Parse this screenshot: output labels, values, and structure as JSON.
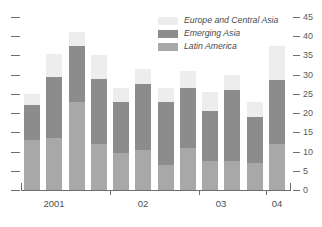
{
  "chart_data": {
    "type": "bar",
    "stacked": true,
    "title": "",
    "subtitle": "",
    "xlabel": "",
    "ylabel": "",
    "ylim": [
      0,
      45
    ],
    "yticks": [
      0,
      5,
      10,
      15,
      20,
      25,
      30,
      35,
      40,
      45
    ],
    "ytick_labels": [
      "0",
      "5",
      "10",
      "15",
      "20",
      "25",
      "30",
      "35",
      "40",
      "45"
    ],
    "y_axis_position": "right",
    "grid": false,
    "legend_position": "top-right",
    "categories": [
      "2001Q1",
      "2001Q2",
      "2001Q3",
      "2001Q4",
      "02Q1",
      "02Q2",
      "02Q3",
      "02Q4",
      "03Q1",
      "03Q2",
      "03Q3",
      "04Q1"
    ],
    "xtick_labels": [
      "2001",
      "02",
      "03",
      "04"
    ],
    "series": [
      {
        "name": "Latin America",
        "color": "#a8a8a8",
        "values": [
          13.0,
          13.5,
          23.0,
          12.0,
          9.5,
          10.5,
          6.5,
          11.0,
          7.5,
          7.5,
          7.0,
          12.0
        ]
      },
      {
        "name": "Emerging Asia",
        "color": "#8c8c8c",
        "values": [
          9.0,
          16.0,
          14.5,
          17.0,
          13.5,
          17.0,
          16.5,
          15.5,
          13.0,
          18.5,
          12.0,
          16.5
        ]
      },
      {
        "name": "Europe and Central Asia",
        "color": "#ededed",
        "values": [
          3.0,
          6.0,
          3.5,
          6.0,
          3.5,
          4.0,
          3.5,
          4.5,
          5.0,
          4.0,
          4.0,
          9.0
        ]
      }
    ],
    "totals": [
      25.0,
      35.5,
      41.0,
      35.0,
      26.5,
      31.5,
      26.5,
      31.0,
      25.5,
      30.0,
      23.0,
      37.5
    ]
  },
  "legend": {
    "items": [
      {
        "label": "Europe and Central Asia",
        "color": "#ededed"
      },
      {
        "label": "Emerging Asia",
        "color": "#8c8c8c"
      },
      {
        "label": "Latin America",
        "color": "#a8a8a8"
      }
    ]
  },
  "axis": {
    "right_labels": [
      "45",
      "40",
      "35",
      "30",
      "25",
      "20",
      "15",
      "10",
      "5",
      "0"
    ],
    "bottom_labels": [
      "2001",
      "02",
      "03",
      "04"
    ]
  }
}
